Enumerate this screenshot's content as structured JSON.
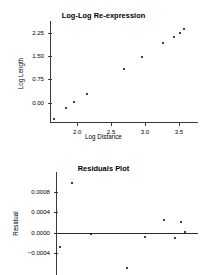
{
  "figures": [
    {
      "id": "log-log-re-expression",
      "title": "Log-Log Re-expression"
    },
    {
      "id": "residuals-plot",
      "title": "Residuals Plot"
    }
  ],
  "chart_data": [
    {
      "type": "scatter",
      "title": "Log-Log Re-expression",
      "xlabel": "Log Distance",
      "ylabel": "Log Length",
      "xticks": [
        "2.0",
        "2.5",
        "3.0",
        "3.5"
      ],
      "xtick_values": [
        2.0,
        2.5,
        3.0,
        3.5
      ],
      "yticks": [
        "0.00",
        "0.75",
        "1.50",
        "2.25"
      ],
      "ytick_values": [
        0.0,
        0.75,
        1.5,
        2.25
      ],
      "xlim": [
        1.6,
        3.78
      ],
      "ylim": [
        -0.62,
        2.62
      ],
      "grid": false,
      "legend": null,
      "x": [
        1.66,
        1.84,
        1.95,
        2.14,
        2.69,
        2.96,
        3.26,
        3.43,
        3.52,
        3.58
      ],
      "y": [
        -0.52,
        -0.16,
        0.01,
        0.29,
        1.09,
        1.47,
        1.92,
        2.11,
        2.24,
        2.36
      ],
      "points": [
        {
          "x": 1.66,
          "y": -0.52
        },
        {
          "x": 1.84,
          "y": -0.16
        },
        {
          "x": 1.95,
          "y": 0.01
        },
        {
          "x": 2.14,
          "y": 0.29
        },
        {
          "x": 2.69,
          "y": 1.09
        },
        {
          "x": 2.96,
          "y": 1.47
        },
        {
          "x": 3.26,
          "y": 1.92
        },
        {
          "x": 3.43,
          "y": 2.11
        },
        {
          "x": 3.52,
          "y": 2.24
        },
        {
          "x": 3.58,
          "y": 2.36
        }
      ]
    },
    {
      "type": "scatter",
      "title": "Residuals Plot",
      "xlabel": "",
      "ylabel": "Residual",
      "xticks": [],
      "xtick_values": [],
      "yticks": [
        "0.0008",
        "0.0004",
        "0.0000",
        "-0.0004"
      ],
      "ytick_values": [
        0.0008,
        0.0004,
        0.0,
        -0.0004
      ],
      "xlim": [
        1.6,
        3.78
      ],
      "ylim": [
        -0.00082,
        0.00118
      ],
      "grid": false,
      "legend": null,
      "reference_line": {
        "orientation": "horizontal",
        "value": 0.0
      },
      "x": [
        1.66,
        1.84,
        2.14,
        2.69,
        2.96,
        3.26,
        3.43,
        3.52,
        3.58
      ],
      "y": [
        -0.00027,
        0.00096,
        -2e-05,
        -0.00069,
        -8e-05,
        0.00024,
        -0.00011,
        0.00021,
        1e-05
      ],
      "points": [
        {
          "x": 1.66,
          "y": -0.00027
        },
        {
          "x": 1.84,
          "y": 0.00096
        },
        {
          "x": 2.14,
          "y": -2e-05
        },
        {
          "x": 2.69,
          "y": -0.00069
        },
        {
          "x": 2.96,
          "y": -8e-05
        },
        {
          "x": 3.26,
          "y": 0.00024
        },
        {
          "x": 3.43,
          "y": -0.00011
        },
        {
          "x": 3.52,
          "y": 0.00021
        },
        {
          "x": 3.58,
          "y": 1e-05
        }
      ]
    }
  ]
}
